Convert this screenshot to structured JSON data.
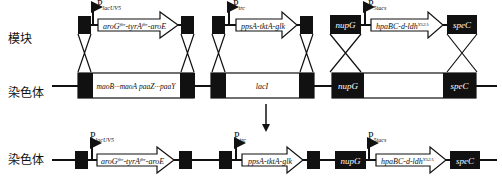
{
  "rows": {
    "module_label": "模块",
    "chromosome_label": "染色体",
    "result_label": "染色体"
  },
  "promoters": {
    "lacUV5": {
      "main": "P",
      "sub": "lacUV5"
    },
    "trc": {
      "main": "P",
      "sub": "trc"
    },
    "5tacs": {
      "main": "P",
      "sub": "5tacs"
    }
  },
  "genes": {
    "aro": {
      "a": "aroG",
      "a_sup": "fbr",
      "b": "-tyrA",
      "b_sup": "fbr",
      "c": "-aroE"
    },
    "pps": "ppsA-tktA-glk",
    "hpa": {
      "a": "hpaBC-d-ldh",
      "sup": "Y52A"
    },
    "nupG": "nupG",
    "speC": "speC",
    "mao": "maoB···maoA paaZ···paaY",
    "lacI": "lacI"
  },
  "colors": {
    "block": "#111111",
    "line": "#111111",
    "fill": "#ffffff"
  }
}
